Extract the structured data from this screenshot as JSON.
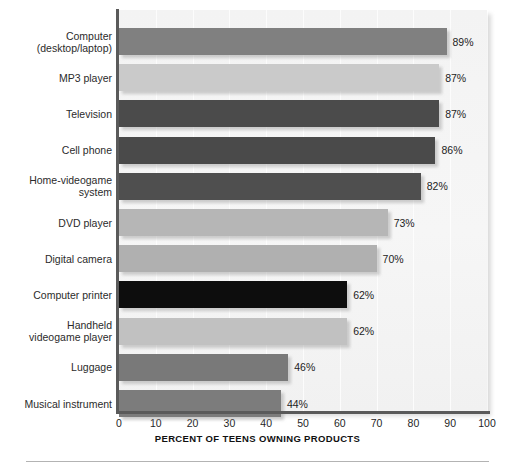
{
  "chart_data": {
    "type": "bar",
    "orientation": "horizontal",
    "title": "",
    "xlabel": "PERCENT OF TEENS OWNING PRODUCTS",
    "ylabel": "",
    "xlim": [
      0,
      100
    ],
    "xticks": [
      0,
      10,
      20,
      30,
      40,
      50,
      60,
      70,
      80,
      90,
      100
    ],
    "xtick_labels": [
      "0",
      "10",
      "20",
      "30",
      "40",
      "50",
      "60",
      "70",
      "80",
      "90",
      "100"
    ],
    "grid": true,
    "legend": "none",
    "value_label_suffix": "%",
    "categories": [
      "Computer (desktop/laptop)",
      "MP3 player",
      "Television",
      "Cell phone",
      "Home-videogame system",
      "DVD player",
      "Digital camera",
      "Computer printer",
      "Handheld videogame player",
      "Luggage",
      "Musical instrument"
    ],
    "values": [
      89,
      87,
      87,
      86,
      82,
      73,
      70,
      62,
      62,
      46,
      44
    ],
    "value_labels": [
      "89%",
      "87%",
      "87%",
      "86%",
      "82%",
      "73%",
      "70%",
      "62%",
      "62%",
      "46%",
      "44%"
    ],
    "bar_colors": [
      "#808080",
      "#cacaca",
      "#4b4b4b",
      "#4a4a4a",
      "#4f4f4f",
      "#b6b6b6",
      "#b0b0b0",
      "#0d0d0d",
      "#c1c1c1",
      "#797979",
      "#7c7c7c"
    ],
    "bars": [
      {
        "label_line1": "Computer",
        "label_line2": "(desktop/laptop)",
        "value": 89,
        "value_label": "89%",
        "color": "#808080"
      },
      {
        "label_line1": "MP3 player",
        "label_line2": "",
        "value": 87,
        "value_label": "87%",
        "color": "#cacaca"
      },
      {
        "label_line1": "Television",
        "label_line2": "",
        "value": 87,
        "value_label": "87%",
        "color": "#4b4b4b"
      },
      {
        "label_line1": "Cell phone",
        "label_line2": "",
        "value": 86,
        "value_label": "86%",
        "color": "#4a4a4a"
      },
      {
        "label_line1": "Home-videogame",
        "label_line2": "system",
        "value": 82,
        "value_label": "82%",
        "color": "#4f4f4f"
      },
      {
        "label_line1": "DVD player",
        "label_line2": "",
        "value": 73,
        "value_label": "73%",
        "color": "#b6b6b6"
      },
      {
        "label_line1": "Digital camera",
        "label_line2": "",
        "value": 70,
        "value_label": "70%",
        "color": "#b0b0b0"
      },
      {
        "label_line1": "Computer printer",
        "label_line2": "",
        "value": 62,
        "value_label": "62%",
        "color": "#0d0d0d"
      },
      {
        "label_line1": "Handheld",
        "label_line2": "videogame player",
        "value": 62,
        "value_label": "62%",
        "color": "#c1c1c1"
      },
      {
        "label_line1": "Luggage",
        "label_line2": "",
        "value": 46,
        "value_label": "46%",
        "color": "#797979"
      },
      {
        "label_line1": "Musical instrument",
        "label_line2": "",
        "value": 44,
        "value_label": "44%",
        "color": "#7c7c7c"
      }
    ]
  },
  "layout": {
    "plot_left": 119,
    "plot_top": 10,
    "plot_width": 368,
    "plot_height": 402,
    "row_height": 36.2,
    "bar_height": 27,
    "row_start": 18
  }
}
